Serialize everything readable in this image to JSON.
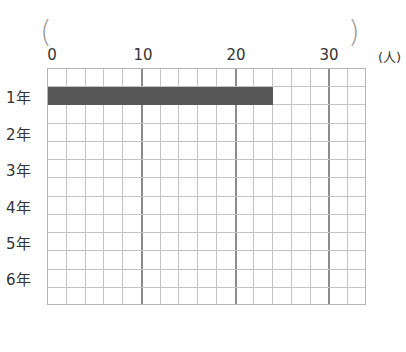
{
  "header": {
    "cut_title": "",
    "answer_blank_left": "(",
    "answer_blank_right": ")"
  },
  "axis": {
    "ticks": [
      "0",
      "10",
      "20",
      "30"
    ],
    "unit": "(人)"
  },
  "rows": [
    "1年",
    "2年",
    "3年",
    "4年",
    "5年",
    "6年"
  ],
  "colors": {
    "bar": "#585858",
    "grid_minor": "#c4c4c4",
    "grid_major": "#8c8c8c"
  },
  "chart_data": {
    "type": "bar",
    "orientation": "horizontal",
    "title": "",
    "categories": [
      "1年",
      "2年",
      "3年",
      "4年",
      "5年",
      "6年"
    ],
    "values": [
      24,
      null,
      null,
      null,
      null,
      null
    ],
    "xlabel": "(人)",
    "ylabel": "",
    "xlim": [
      0,
      34
    ],
    "xticks": [
      0,
      10,
      20,
      30
    ],
    "grid": true,
    "grid_minor_step": 2,
    "legend": null
  }
}
